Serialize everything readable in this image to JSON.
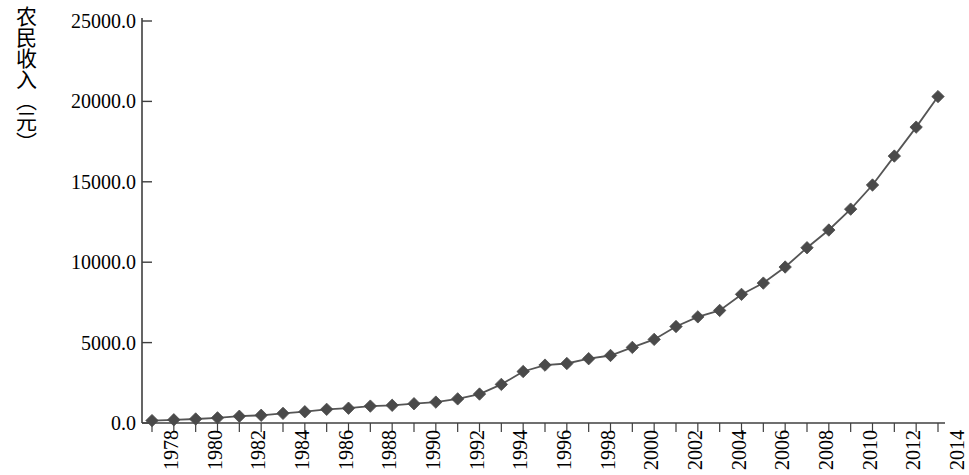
{
  "chart_data": {
    "type": "line",
    "title": "",
    "subtitle": "",
    "xlabel": "",
    "ylabel": "农民收入（元）",
    "ylim": [
      0,
      25000
    ],
    "xlim": [
      1978,
      2014
    ],
    "grid": false,
    "legend": null,
    "marker": "diamond",
    "series_color": "#4a4a4a",
    "line_color": "#555555",
    "y_ticks": [
      0,
      5000,
      10000,
      15000,
      20000,
      25000
    ],
    "y_tick_labels": [
      "0.0",
      "5000.0",
      "10000.0",
      "15000.0",
      "20000.0",
      "25000.0"
    ],
    "x_tick_labels": [
      "1978",
      "1980",
      "1982",
      "1984",
      "1986",
      "1988",
      "1990",
      "1992",
      "1994",
      "1996",
      "1998",
      "2000",
      "2002",
      "2004",
      "2006",
      "2008",
      "2010",
      "2012",
      "2014"
    ],
    "x_tick_step": 2,
    "x_minor_step": 1,
    "x": [
      1978,
      1979,
      1980,
      1981,
      1982,
      1983,
      1984,
      1985,
      1986,
      1987,
      1988,
      1989,
      1990,
      1991,
      1992,
      1993,
      1994,
      1995,
      1996,
      1997,
      1998,
      1999,
      2000,
      2001,
      2002,
      2003,
      2004,
      2005,
      2006,
      2007,
      2008,
      2009,
      2010,
      2011,
      2012,
      2013,
      2014
    ],
    "values": [
      134,
      160,
      191,
      223,
      270,
      310,
      355,
      398,
      424,
      463,
      545,
      602,
      686,
      709,
      784,
      922,
      1221,
      1578,
      1926,
      2090,
      2162,
      2210,
      2253,
      2366,
      2476,
      2622,
      2936,
      3255,
      3587,
      4140,
      4761,
      5153,
      5919,
      6977,
      7917,
      8896,
      9892
    ],
    "values_plotted": [
      150,
      200,
      250,
      320,
      420,
      480,
      600,
      700,
      850,
      920,
      1050,
      1100,
      1200,
      1300,
      1500,
      1800,
      2400,
      3200,
      3600,
      3700,
      4000,
      4200,
      4700,
      5200,
      6000,
      6600,
      7000,
      8000,
      8700,
      9700,
      10900,
      12000,
      13300,
      14800,
      16600,
      18400,
      20300
    ],
    "annotations": []
  },
  "axis": {
    "y_title": "农民收入（元）",
    "tick_count_x": 37,
    "tick_count_y": 6
  }
}
